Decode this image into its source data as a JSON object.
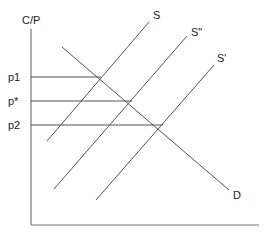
{
  "diagram": {
    "y_axis_label": "C/P",
    "x_axis_label": "",
    "price_levels": [
      {
        "label": "p1",
        "y": 77,
        "x_end": 101
      },
      {
        "label": "p*",
        "y": 101,
        "x_end": 132
      },
      {
        "label": "p2",
        "y": 125,
        "x_end": 163
      }
    ],
    "curves": [
      {
        "name": "demand",
        "label": "D",
        "x1": 62,
        "y1": 47,
        "x2": 229,
        "y2": 190,
        "lx": 233,
        "ly": 199
      },
      {
        "name": "supply-s",
        "label": "S",
        "x1": 47,
        "y1": 141,
        "x2": 149,
        "y2": 22,
        "lx": 153,
        "ly": 19
      },
      {
        "name": "supply-s-double-prime",
        "label": "S\"",
        "x1": 54,
        "y1": 189,
        "x2": 187,
        "y2": 36,
        "lx": 191,
        "ly": 36
      },
      {
        "name": "supply-s-prime",
        "label": "S'",
        "x1": 96,
        "y1": 200,
        "x2": 214,
        "y2": 65,
        "lx": 217,
        "ly": 62
      }
    ],
    "colors": {
      "line": "#555555",
      "axis": "#777777",
      "text": "#222222"
    }
  }
}
